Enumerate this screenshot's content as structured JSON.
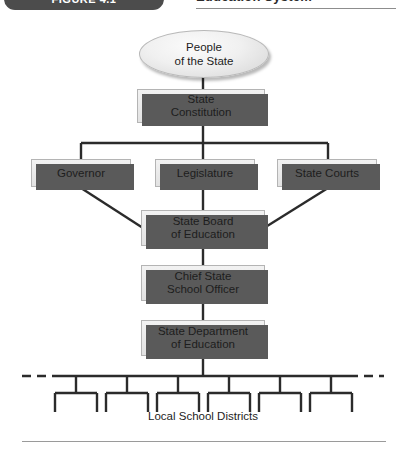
{
  "header": {
    "badge": "FIGURE 4.1",
    "title": "Education System"
  },
  "diagram": {
    "nodes": {
      "people": "People\nof the State",
      "constitution": "State\nConstitution",
      "governor": "Governor",
      "legislature": "Legislature",
      "courts": "State Courts",
      "board": "State Board\nof Education",
      "chief": "Chief State\nSchool Officer",
      "department": "State Department\nof Education"
    },
    "districts_label": "Local School Districts",
    "district_count": 6,
    "colors": {
      "node_fill": "#ebebeb",
      "node_border": "#b4b4b4",
      "node_shadow": "#5a5a5a",
      "connector": "#2b2b2b",
      "badge_bg": "#4c4c4c",
      "text": "#1d1d1d"
    }
  }
}
